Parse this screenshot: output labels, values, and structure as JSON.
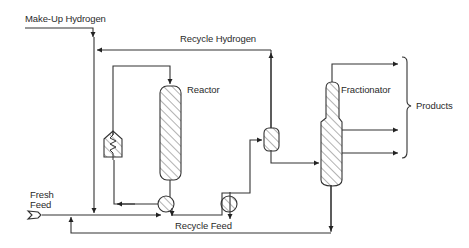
{
  "diagram": {
    "type": "process-flow-diagram",
    "labels": {
      "makeup_hydrogen": "Make-Up Hydrogen",
      "recycle_hydrogen": "Recycle Hydrogen",
      "reactor": "Reactor",
      "fractionator": "Fractionator",
      "products": "Products",
      "fresh_feed_line1": "Fresh",
      "fresh_feed_line2": "Feed",
      "recycle_feed": "Recycle Feed"
    },
    "units": [
      {
        "id": "furnace",
        "name": "Furnace / Heater"
      },
      {
        "id": "reactor",
        "name": "Reactor"
      },
      {
        "id": "exchanger-1",
        "name": "Heat Exchanger"
      },
      {
        "id": "exchanger-2",
        "name": "Cooler"
      },
      {
        "id": "separator",
        "name": "Separator"
      },
      {
        "id": "fractionator",
        "name": "Fractionator"
      }
    ],
    "streams": [
      {
        "from": "Make-Up Hydrogen",
        "to": "feed line"
      },
      {
        "from": "separator",
        "to": "feed line",
        "label": "Recycle Hydrogen"
      },
      {
        "from": "Fresh Feed",
        "to": "exchanger-1"
      },
      {
        "from": "exchanger-1",
        "to": "furnace"
      },
      {
        "from": "furnace",
        "to": "reactor"
      },
      {
        "from": "reactor",
        "to": "exchanger-1"
      },
      {
        "from": "exchanger-1",
        "to": "exchanger-2"
      },
      {
        "from": "exchanger-2",
        "to": "separator"
      },
      {
        "from": "separator",
        "to": "fractionator"
      },
      {
        "from": "fractionator",
        "to": "Products",
        "count": 3
      },
      {
        "from": "fractionator",
        "to": "feed line",
        "label": "Recycle Feed"
      }
    ],
    "colors": {
      "line": "#333333",
      "background": "#ffffff"
    }
  }
}
